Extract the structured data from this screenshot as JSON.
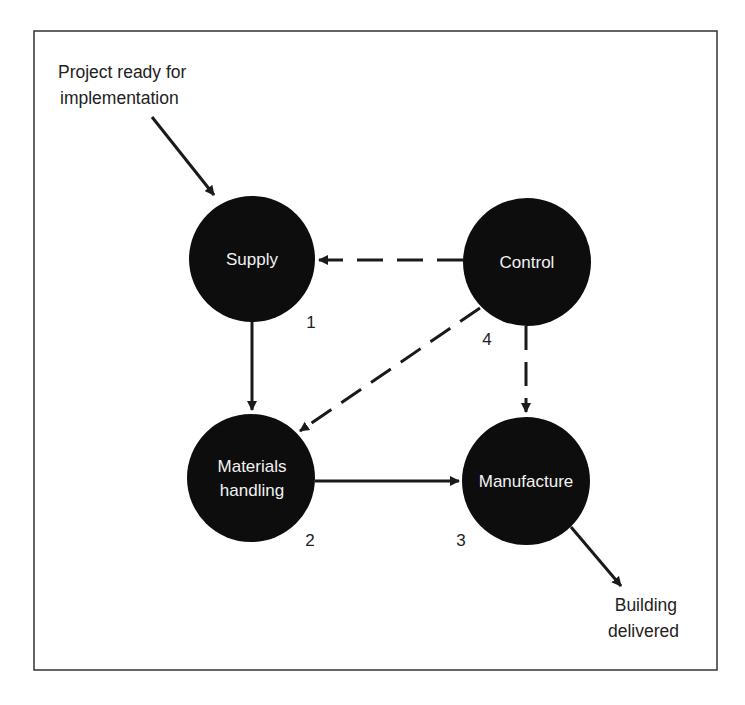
{
  "diagram": {
    "frame": {
      "x": 34,
      "y": 31,
      "w": 683,
      "h": 639
    },
    "colors": {
      "node_fill": "#0d0d0d",
      "node_text": "#f2f2f2",
      "line": "#1a1a1a",
      "frame": "#333333",
      "text": "#222222"
    },
    "nodes": [
      {
        "id": "supply",
        "label_lines": [
          "Supply"
        ],
        "number": "1",
        "cx": 252,
        "cy": 259,
        "r": 63
      },
      {
        "id": "materials",
        "label_lines": [
          "Materials",
          "handling"
        ],
        "number": "2",
        "cx": 251,
        "cy": 478,
        "r": 64
      },
      {
        "id": "manufacture",
        "label_lines": [
          "Manufacture"
        ],
        "number": "3",
        "cx": 526,
        "cy": 481,
        "r": 64
      },
      {
        "id": "control",
        "label_lines": [
          "Control"
        ],
        "number": "4",
        "cx": 527,
        "cy": 262,
        "r": 64
      }
    ],
    "input": {
      "label_lines": [
        "Project ready for",
        "implementation"
      ],
      "target": "supply"
    },
    "output": {
      "label_lines": [
        "Building",
        "delivered"
      ],
      "source": "manufacture"
    },
    "edges": [
      {
        "from": "input",
        "to": "supply",
        "style": "solid"
      },
      {
        "from": "supply",
        "to": "materials",
        "style": "solid"
      },
      {
        "from": "materials",
        "to": "manufacture",
        "style": "solid"
      },
      {
        "from": "control",
        "to": "supply",
        "style": "dashed"
      },
      {
        "from": "control",
        "to": "materials",
        "style": "dashed"
      },
      {
        "from": "control",
        "to": "manufacture",
        "style": "dashed"
      },
      {
        "from": "manufacture",
        "to": "output",
        "style": "solid"
      }
    ]
  }
}
